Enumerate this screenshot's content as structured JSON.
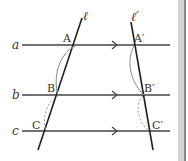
{
  "diagram": {
    "lines": {
      "a": {
        "label": "a"
      },
      "b": {
        "label": "b"
      },
      "c": {
        "label": "c"
      },
      "l": {
        "label": "ℓ"
      },
      "l_prime": {
        "label": "ℓ′"
      }
    },
    "points": {
      "A": {
        "label": "A"
      },
      "B": {
        "label": "B"
      },
      "C": {
        "label": "C"
      },
      "A_prime": {
        "label": "A′"
      },
      "B_prime": {
        "label": "B′"
      },
      "C_prime": {
        "label": "C′"
      }
    },
    "colors": {
      "line": "#333333",
      "arc_solid": "#888888",
      "arc_dashed": "#999999",
      "side_bar": "#cfcfcf"
    }
  }
}
